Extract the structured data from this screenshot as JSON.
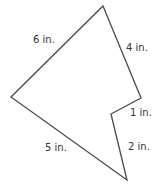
{
  "diagram": {
    "type": "polygon",
    "stroke_color": "#4a4a4a",
    "text_color": "#333333",
    "vertices": [
      {
        "name": "top",
        "x": 103,
        "y": 6
      },
      {
        "name": "right",
        "x": 141,
        "y": 98
      },
      {
        "name": "notch",
        "x": 111,
        "y": 114
      },
      {
        "name": "bottom",
        "x": 127,
        "y": 180
      },
      {
        "name": "left",
        "x": 11,
        "y": 97
      }
    ],
    "sides": [
      {
        "from": "left",
        "to": "top",
        "label": "6 in.",
        "length": 6,
        "unit": "in."
      },
      {
        "from": "top",
        "to": "right",
        "label": "4 in.",
        "length": 4,
        "unit": "in."
      },
      {
        "from": "right",
        "to": "notch",
        "label": "1 in.",
        "length": 1,
        "unit": "in."
      },
      {
        "from": "notch",
        "to": "bottom",
        "label": "2 in.",
        "length": 2,
        "unit": "in."
      },
      {
        "from": "bottom",
        "to": "left",
        "label": "5 in.",
        "length": 5,
        "unit": "in."
      }
    ]
  }
}
